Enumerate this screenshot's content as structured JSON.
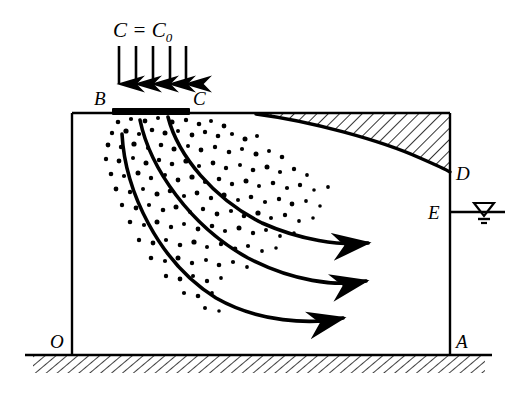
{
  "figure": {
    "kind": "cross-section-diagram",
    "background_color": "#ffffff",
    "line_color": "#000000"
  },
  "labels": {
    "source_concentration": "C = C",
    "source_concentration_subscript": "0",
    "point_B": "B",
    "point_C": "C",
    "point_D": "D",
    "point_E": "E",
    "point_O": "O",
    "point_A": "A"
  },
  "elements": {
    "domain_box": {
      "name": "aquifer-domain-rectangle",
      "left": 72,
      "top": 113,
      "right": 450,
      "bottom": 341
    },
    "source_bar": {
      "name": "contaminant-source-strip",
      "x1": 112,
      "x2": 190,
      "y": 112,
      "thickness": 6
    },
    "infiltration_arrows": {
      "name": "infiltration-arrows",
      "count": 5,
      "x_positions": [
        119,
        136,
        153,
        170,
        186
      ],
      "y_start": 46,
      "y_end": 93
    },
    "flow_lines": [
      {
        "name": "flow-line-upper",
        "start": [
          168,
          117
        ],
        "end": [
          372,
          243
        ]
      },
      {
        "name": "flow-line-middle",
        "start": [
          140,
          120
        ],
        "end": [
          370,
          281
        ]
      },
      {
        "name": "flow-line-lower",
        "start": [
          122,
          134
        ],
        "end": [
          347,
          318
        ]
      }
    ],
    "phreatic_surface": {
      "name": "phreatic-surface-curve",
      "start": [
        256,
        114
      ],
      "end": [
        450,
        172
      ]
    },
    "unsaturated_zone": {
      "name": "unsaturated-hatched-zone",
      "hatch_angle_deg": 45,
      "hatch_spacing": 8
    },
    "bedrock": {
      "name": "bedrock-hatched-base",
      "line_y": 355,
      "line_x1": 25,
      "line_x2": 492,
      "hatch_depth": 18
    },
    "water_table_symbol": {
      "name": "water-table-symbol",
      "line_y": 212,
      "line_x1": 450,
      "line_x2": 505,
      "triangle_center_x": 484
    },
    "plume": {
      "name": "contaminant-plume-dots",
      "dot_count": 150,
      "dot_radius_range": [
        1.6,
        2.8
      ]
    }
  }
}
